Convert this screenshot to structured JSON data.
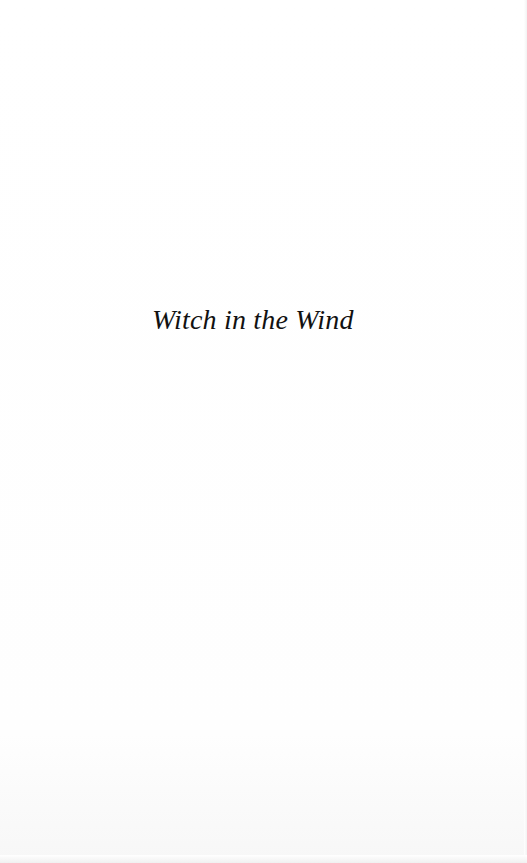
{
  "page": {
    "type": "half-title",
    "background_color": "#ffffff",
    "text_color": "#111111"
  },
  "title": {
    "text": "Witch in the Wind"
  }
}
